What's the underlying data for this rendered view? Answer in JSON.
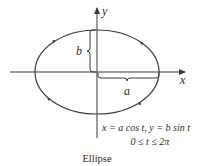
{
  "diagram": {
    "type": "parametric-ellipse",
    "axes": {
      "x_label": "x",
      "y_label": "y"
    },
    "semi_axes": {
      "horizontal": "a",
      "vertical": "b"
    },
    "equation": {
      "line1": "x = a cos t, y = b sin t",
      "line2": "0 ≤ t ≤ 2π"
    },
    "caption": "Ellipse",
    "orientation": "counterclockwise arrows on curve",
    "colors": {
      "stroke": "#3a3a3a",
      "text": "#2a2a2a",
      "background": "#ffffff"
    }
  }
}
